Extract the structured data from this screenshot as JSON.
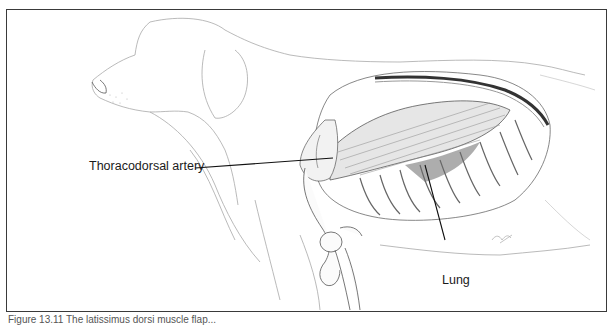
{
  "figure": {
    "labels": {
      "thoracodorsal": "Thoracodorsal artery",
      "lung": "Lung"
    },
    "caption_partial": "Figure 13.11 The latissimus dorsi muscle flap...",
    "signature": "artist-signature"
  },
  "colors": {
    "frame": "#3a3a3a",
    "line": "#1a1a1a",
    "sketch": "#9a9a9a",
    "shade": "#555555"
  }
}
